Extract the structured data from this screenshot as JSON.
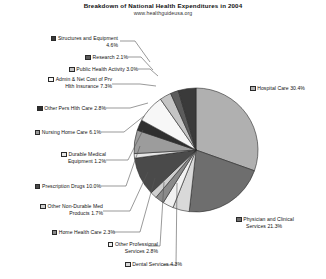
{
  "header": {
    "title": "Breakdown of National Health Expenditures in 2004",
    "subtitle": "www.healthguideusa.org"
  },
  "chart_data": {
    "type": "pie",
    "title": "Breakdown of National Health Expenditures in 2004",
    "subtitle": "www.healthguideusa.org",
    "units": "percent",
    "legend_position": "callout-labels",
    "grid": false,
    "categories": [
      "Hospital Care",
      "Physician and Clinical Services",
      "Dental Services",
      "Other Professional Services",
      "Home Health Care",
      "Other Non-Durable Medical Products",
      "Prescription Drugs",
      "Durable Medical Equipment",
      "Nursing Home Care",
      "Other Pers Hlth Care",
      "Admin & Net Cost of Prv Hlth Insurance",
      "Public Health Activity",
      "Research",
      "Structures and Equipment"
    ],
    "values": [
      30.4,
      21.3,
      4.3,
      2.8,
      2.3,
      1.7,
      10.0,
      1.2,
      6.1,
      2.8,
      7.3,
      3.0,
      2.1,
      4.6
    ],
    "colors": [
      "#b0b0b0",
      "#6e6e6e",
      "#d9d9d9",
      "#f2f2f2",
      "#8a8a8a",
      "#cfcfcf",
      "#4a4a4a",
      "#e6e6e6",
      "#9c9c9c",
      "#2f2f2f",
      "#f7f7f7",
      "#c4c4c4",
      "#5c5c5c",
      "#3a3a3a"
    ]
  },
  "slices": [
    {
      "label_line1": "Hospital Care  30.4%",
      "label_line2": "",
      "value": "30.4%"
    },
    {
      "label_line1": "Physician and Clinical",
      "label_line2": "Services  21.3%",
      "value": "21.3%"
    },
    {
      "label_line1": "Dental Services  4.3%",
      "label_line2": "",
      "value": "4.3%"
    },
    {
      "label_line1": "Other Professional",
      "label_line2": "Services  2.8%",
      "value": "2.8%"
    },
    {
      "label_line1": "Home Health Care  2.3%",
      "label_line2": "",
      "value": "2.3%"
    },
    {
      "label_line1": "Other Non-Durable Med",
      "label_line2": "Products  1.7%",
      "value": "1.7%"
    },
    {
      "label_line1": "Prescription Drugs  10.0%",
      "label_line2": "",
      "value": "10.0%"
    },
    {
      "label_line1": "Durable Medical",
      "label_line2": "Equipment  1.2%",
      "value": "1.2%"
    },
    {
      "label_line1": "Nursing Home Care  6.1%",
      "label_line2": "",
      "value": "6.1%"
    },
    {
      "label_line1": "Other Pers Hlth Care  2.8%",
      "label_line2": "",
      "value": "2.8%"
    },
    {
      "label_line1": "Admin  & Net Cost of Prv",
      "label_line2": "Hlth Insurance  7.3%",
      "value": "7.3%"
    },
    {
      "label_line1": "Public Health Activity  3.0%",
      "label_line2": "",
      "value": "3.0%"
    },
    {
      "label_line1": "Research  2.1%",
      "label_line2": "",
      "value": "2.1%"
    },
    {
      "label_line1": "Structures and Equipment",
      "label_line2": "4.6%",
      "value": "4.6%"
    }
  ]
}
